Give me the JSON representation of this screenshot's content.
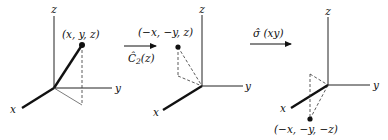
{
  "diagram": {
    "panels": [
      {
        "id": "original",
        "axes": {
          "x": "x",
          "y": "y",
          "z": "z"
        },
        "point_label": "(x, y, z)"
      },
      {
        "id": "after-c2z",
        "axes": {
          "x": "x",
          "y": "y",
          "z": "z"
        },
        "point_label": "(−x, −y, z)"
      },
      {
        "id": "after-sigma-xy",
        "axes": {
          "x": "x",
          "y": "y",
          "z": "z"
        },
        "point_label": "(−x, −y, −z)"
      }
    ],
    "operations": [
      {
        "id": "c2z",
        "symbol": "C",
        "hat": "^",
        "subscript": "2",
        "argument": "(z)",
        "label": "Ĉ₂(z)"
      },
      {
        "id": "sigma-xy",
        "symbol": "σ",
        "hat": "^",
        "argument": "(xy)",
        "label": "σ̂ (xy)"
      }
    ]
  }
}
